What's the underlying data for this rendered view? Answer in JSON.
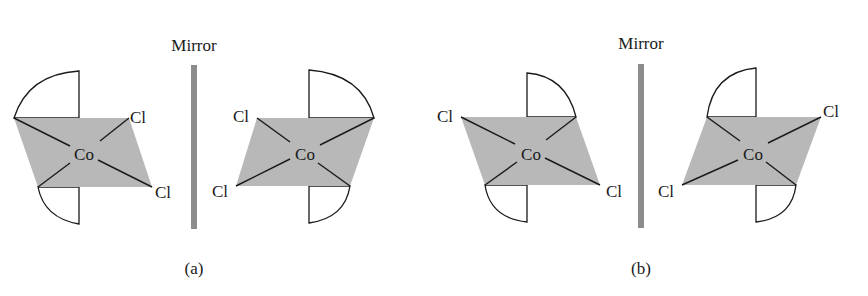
{
  "figure": {
    "panels": [
      {
        "label": "(a)",
        "mirror_label": "Mirror",
        "description": "cis-[Co(en)2Cl2]+ enantiomer pair reflected through mirror plane",
        "molecules": [
          {
            "center_atom": "Co",
            "ligand_atoms": [
              "Cl",
              "Cl"
            ],
            "chelate_rings": 2
          },
          {
            "center_atom": "Co",
            "ligand_atoms": [
              "Cl",
              "Cl"
            ],
            "chelate_rings": 2
          }
        ]
      },
      {
        "label": "(b)",
        "mirror_label": "Mirror",
        "description": "trans-arrangement molecule and its mirror image",
        "molecules": [
          {
            "center_atom": "Co",
            "ligand_atoms": [
              "Cl",
              "Cl"
            ],
            "chelate_rings": 2
          },
          {
            "center_atom": "Co",
            "ligand_atoms": [
              "Cl",
              "Cl"
            ],
            "chelate_rings": 2
          }
        ]
      }
    ],
    "colors": {
      "plane_fill": "#b8b8b8",
      "mirror_bar": "#8c8c8c",
      "line": "#1a1a1a",
      "background": "#ffffff"
    }
  }
}
